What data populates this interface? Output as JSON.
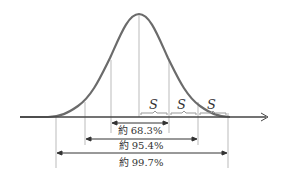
{
  "diagram": {
    "sigma_label": "S",
    "ranges": [
      {
        "label": "約 68.3%",
        "span": "±1σ"
      },
      {
        "label": "約 95.4%",
        "span": "±2σ"
      },
      {
        "label": "約 99.7%",
        "span": "±3σ"
      }
    ],
    "colors": {
      "curve": "#6b6b6b",
      "axis": "#444444",
      "lines": "#999999",
      "arrows": "#333333"
    }
  }
}
